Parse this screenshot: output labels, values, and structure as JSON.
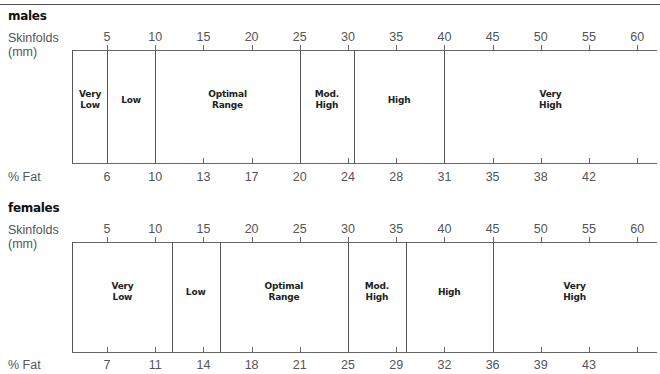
{
  "chart_data": [
    {
      "type": "table",
      "title": "males",
      "xlabel": "Skinfolds (mm)",
      "x2label": "% Fat",
      "skinfold_ticks": [
        5,
        10,
        15,
        20,
        25,
        30,
        35,
        40,
        45,
        50,
        55,
        60
      ],
      "fat_ticks": [
        {
          "skinfold": 5,
          "label": "6"
        },
        {
          "skinfold": 10,
          "label": "10"
        },
        {
          "skinfold": 15,
          "label": "13"
        },
        {
          "skinfold": 20,
          "label": "17"
        },
        {
          "skinfold": 25,
          "label": "20"
        },
        {
          "skinfold": 30,
          "label": "24"
        },
        {
          "skinfold": 35,
          "label": "28"
        },
        {
          "skinfold": 40,
          "label": "31"
        },
        {
          "skinfold": 45,
          "label": "35"
        },
        {
          "skinfold": 50,
          "label": "38"
        },
        {
          "skinfold": 55,
          "label": "42"
        },
        {
          "skinfold": 60,
          "label": ""
        }
      ],
      "zones": [
        {
          "label": "Very\nLow",
          "from": 1.5,
          "to": 5
        },
        {
          "label": "Low",
          "from": 5,
          "to": 10
        },
        {
          "label": "Optimal\nRange",
          "from": 10,
          "to": 25
        },
        {
          "label": "Mod.\nHigh",
          "from": 25,
          "to": 30.6
        },
        {
          "label": "High",
          "from": 30.6,
          "to": 40
        },
        {
          "label": "Very\nHigh",
          "from": 40,
          "to": 62
        }
      ]
    },
    {
      "type": "table",
      "title": "females",
      "xlabel": "Skinfolds (mm)",
      "x2label": "% Fat",
      "skinfold_ticks": [
        5,
        10,
        15,
        20,
        25,
        30,
        35,
        40,
        45,
        50,
        55,
        60
      ],
      "fat_ticks": [
        {
          "skinfold": 5,
          "label": "7"
        },
        {
          "skinfold": 10,
          "label": "11"
        },
        {
          "skinfold": 15,
          "label": "14"
        },
        {
          "skinfold": 20,
          "label": "18"
        },
        {
          "skinfold": 25,
          "label": "21"
        },
        {
          "skinfold": 30,
          "label": "25"
        },
        {
          "skinfold": 35,
          "label": "29"
        },
        {
          "skinfold": 40,
          "label": "32"
        },
        {
          "skinfold": 45,
          "label": "36"
        },
        {
          "skinfold": 50,
          "label": "39"
        },
        {
          "skinfold": 55,
          "label": "43"
        },
        {
          "skinfold": 60,
          "label": ""
        }
      ],
      "zones": [
        {
          "label": "Very\nLow",
          "from": 1.5,
          "to": 11.7
        },
        {
          "label": "Low",
          "from": 11.7,
          "to": 16.7
        },
        {
          "label": "Optimal\nRange",
          "from": 16.7,
          "to": 30
        },
        {
          "label": "Mod.\nHigh",
          "from": 30,
          "to": 36
        },
        {
          "label": "High",
          "from": 36,
          "to": 45
        },
        {
          "label": "Very\nHigh",
          "from": 45,
          "to": 62
        }
      ]
    }
  ],
  "labels": {
    "males": "males",
    "females": "females",
    "skinfolds_line1": "Skinfolds",
    "skinfolds_line2": "(mm)",
    "pct_fat": "% Fat"
  }
}
